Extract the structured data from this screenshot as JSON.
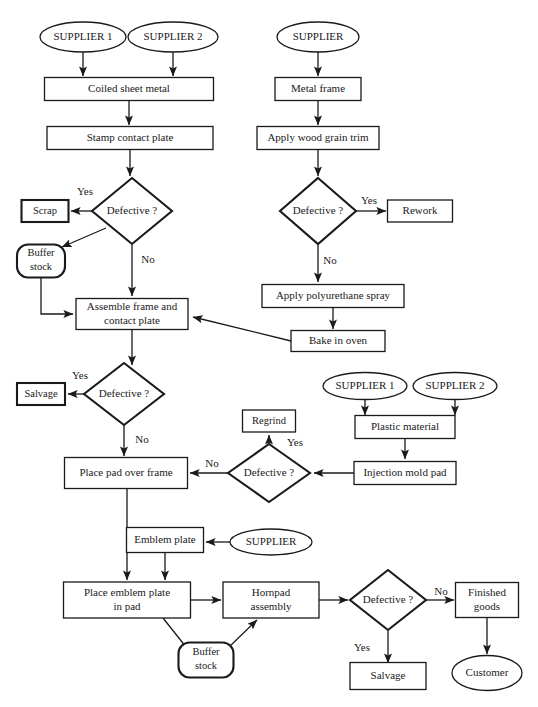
{
  "diagram": {
    "colors": {
      "stroke": "#1a1a1a",
      "fill": "#ffffff",
      "background": "#ffffff"
    },
    "nodes": [
      {
        "id": "sup1_top",
        "shape": "ellipse",
        "label": "SUPPLIER 1",
        "label2": "",
        "x": 83,
        "y": 37,
        "w": 86,
        "h": 30
      },
      {
        "id": "sup2_top",
        "shape": "ellipse",
        "label": "SUPPLIER 2",
        "label2": "",
        "x": 173,
        "y": 37,
        "w": 90,
        "h": 30
      },
      {
        "id": "sup_frame",
        "shape": "ellipse",
        "label": "SUPPLIER",
        "label2": "",
        "x": 318,
        "y": 37,
        "w": 82,
        "h": 30
      },
      {
        "id": "coiled",
        "shape": "rect",
        "label": "Coiled sheet metal",
        "label2": "",
        "x": 129,
        "y": 89,
        "w": 169,
        "h": 23
      },
      {
        "id": "metalframe",
        "shape": "rect",
        "label": "Metal frame",
        "label2": "",
        "x": 318,
        "y": 89,
        "w": 86,
        "h": 23
      },
      {
        "id": "stamp",
        "shape": "rect",
        "label": "Stamp contact plate",
        "label2": "",
        "x": 130,
        "y": 138,
        "w": 166,
        "h": 23
      },
      {
        "id": "woodgrain",
        "shape": "rect",
        "label": "Apply wood grain trim",
        "label2": "",
        "x": 318,
        "y": 138,
        "w": 122,
        "h": 23
      },
      {
        "id": "def1",
        "shape": "diamond",
        "label": "Defective ?",
        "label2": "",
        "x": 132,
        "y": 211,
        "w": 80,
        "h": 66
      },
      {
        "id": "def2",
        "shape": "diamond",
        "label": "Defective ?",
        "label2": "",
        "x": 318,
        "y": 211,
        "w": 76,
        "h": 66
      },
      {
        "id": "scrap",
        "shape": "rect",
        "label": "Scrap",
        "label2": "",
        "x": 45,
        "y": 211,
        "w": 47,
        "h": 22
      },
      {
        "id": "rework",
        "shape": "rect",
        "label": "Rework",
        "label2": "",
        "x": 420,
        "y": 211,
        "w": 65,
        "h": 22
      },
      {
        "id": "buffer1",
        "shape": "stadium",
        "label": "Buffer",
        "label2": "stock",
        "x": 41,
        "y": 261,
        "w": 48,
        "h": 33
      },
      {
        "id": "polyspray",
        "shape": "rect",
        "label": "Apply polyurethane spray",
        "label2": "",
        "x": 333,
        "y": 296,
        "w": 142,
        "h": 23
      },
      {
        "id": "assemble",
        "shape": "rect",
        "label": "Assemble frame and",
        "label2": "contact plate",
        "x": 132,
        "y": 314,
        "w": 112,
        "h": 31
      },
      {
        "id": "bake",
        "shape": "rect",
        "label": "Bake in oven",
        "label2": "",
        "x": 338,
        "y": 341,
        "w": 94,
        "h": 21
      },
      {
        "id": "def3",
        "shape": "diamond",
        "label": "Defective ?",
        "label2": "",
        "x": 124,
        "y": 394,
        "w": 80,
        "h": 62
      },
      {
        "id": "salvage1",
        "shape": "rect",
        "label": "Salvage",
        "label2": "",
        "x": 41,
        "y": 394,
        "w": 48,
        "h": 22
      },
      {
        "id": "regrind",
        "shape": "rect",
        "label": "Regrind",
        "label2": "",
        "x": 269,
        "y": 421,
        "w": 53,
        "h": 22
      },
      {
        "id": "sup1_plas",
        "shape": "ellipse",
        "label": "SUPPLIER 1",
        "label2": "",
        "x": 365,
        "y": 386,
        "w": 84,
        "h": 27
      },
      {
        "id": "sup2_plas",
        "shape": "ellipse",
        "label": "SUPPLIER 2",
        "label2": "",
        "x": 455,
        "y": 386,
        "w": 84,
        "h": 27
      },
      {
        "id": "plastic",
        "shape": "rect",
        "label": "Plastic material",
        "label2": "",
        "x": 405,
        "y": 427,
        "w": 100,
        "h": 23
      },
      {
        "id": "def4",
        "shape": "diamond",
        "label": "Defective ?",
        "label2": "",
        "x": 269,
        "y": 473,
        "w": 82,
        "h": 58
      },
      {
        "id": "injection",
        "shape": "rect",
        "label": "Injection mold pad",
        "label2": "",
        "x": 405,
        "y": 473,
        "w": 102,
        "h": 23
      },
      {
        "id": "placepad",
        "shape": "rect",
        "label": "Place pad over frame",
        "label2": "",
        "x": 126,
        "y": 473,
        "w": 123,
        "h": 31
      },
      {
        "id": "emblem",
        "shape": "rect",
        "label": "Emblem plate",
        "label2": "",
        "x": 165,
        "y": 540,
        "w": 77,
        "h": 25
      },
      {
        "id": "sup_emblem",
        "shape": "ellipse",
        "label": "SUPPLIER",
        "label2": "",
        "x": 271,
        "y": 542,
        "w": 82,
        "h": 26
      },
      {
        "id": "placeemblem",
        "shape": "rect",
        "label": "Place emblem plate",
        "label2": "in pad",
        "x": 127,
        "y": 600,
        "w": 127,
        "h": 36
      },
      {
        "id": "hornpad",
        "shape": "rect",
        "label": "Hornpad",
        "label2": "assembly",
        "x": 271,
        "y": 600,
        "w": 96,
        "h": 36
      },
      {
        "id": "buffer2",
        "shape": "stadium",
        "label": "Buffer",
        "label2": "stock",
        "x": 206,
        "y": 660,
        "w": 55,
        "h": 35
      },
      {
        "id": "def5",
        "shape": "diamond",
        "label": "Defective ?",
        "label2": "",
        "x": 388,
        "y": 600,
        "w": 76,
        "h": 60
      },
      {
        "id": "finished",
        "shape": "rect",
        "label": "Finished",
        "label2": "goods",
        "x": 487,
        "y": 600,
        "w": 63,
        "h": 35
      },
      {
        "id": "salvage2",
        "shape": "rect",
        "label": "Salvage",
        "label2": "",
        "x": 388,
        "y": 676,
        "w": 76,
        "h": 27
      },
      {
        "id": "customer",
        "shape": "ellipse",
        "label": "Customer",
        "label2": "",
        "x": 487,
        "y": 673,
        "w": 70,
        "h": 35
      }
    ],
    "edge_labels": [
      {
        "id": "yes1",
        "text": "Yes",
        "x": 85,
        "y": 192
      },
      {
        "id": "no1",
        "text": "No",
        "x": 148,
        "y": 260
      },
      {
        "id": "yes2",
        "text": "Yes",
        "x": 369,
        "y": 201
      },
      {
        "id": "no2",
        "text": "No",
        "x": 330,
        "y": 261
      },
      {
        "id": "yes3",
        "text": "Yes",
        "x": 80,
        "y": 376
      },
      {
        "id": "no3",
        "text": "No",
        "x": 142,
        "y": 440
      },
      {
        "id": "yes4",
        "text": "Yes",
        "x": 295,
        "y": 443
      },
      {
        "id": "no4",
        "text": "No",
        "x": 212,
        "y": 464
      },
      {
        "id": "yes5",
        "text": "Yes",
        "x": 362,
        "y": 648
      },
      {
        "id": "no5",
        "text": "No",
        "x": 441,
        "y": 592
      }
    ]
  }
}
